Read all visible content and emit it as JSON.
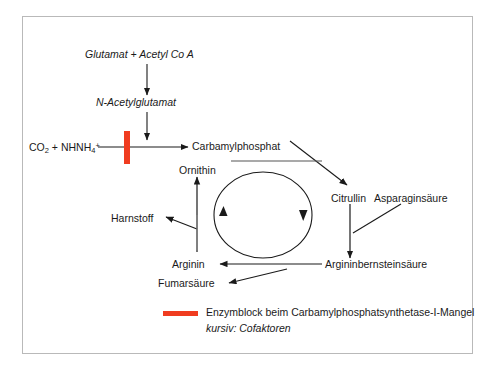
{
  "diagram": {
    "accent_color": "#f03c20",
    "line_color": "#1a1a1a",
    "frame_color": "#b9b9b9",
    "nodes": {
      "glutamat_acetyl": "Glutamat + Acetyl Co A",
      "n_acetylglutamat": "N-Acetylglutamat",
      "co2_nh4_prefix": "CO",
      "co2_nh4_sub1": "2",
      "co2_nh4_mid": " + NH",
      "co2_nh4_sub2": "4",
      "co2_nh4_sup": "+",
      "carbamylphosphat": "Carbamylphosphat",
      "ornithin": "Ornithin",
      "harnstoff": "Harnstoff",
      "arginin": "Arginin",
      "fumarsaeure": "Fumarsäure",
      "citrullin": "Citrullin",
      "asparaginsaeure": "Asparaginsäure",
      "argininbernsteinsaeure": "Argininbernsteinsäure"
    },
    "legend": {
      "enzyme_block_label": "Enzymblock beim Carbamylphosphatsynthetase-I-Mangel",
      "cofactor_note": "kursiv: Cofaktoren"
    }
  }
}
